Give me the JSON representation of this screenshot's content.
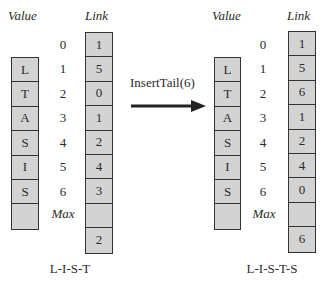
{
  "left": {
    "value_header": "Value",
    "link_header": "Link",
    "indices": [
      "0",
      "1",
      "2",
      "3",
      "4",
      "5",
      "6",
      "Max"
    ],
    "values": [
      "L",
      "T",
      "A",
      "S",
      "I",
      "S",
      ""
    ],
    "links": [
      "1",
      "5",
      "0",
      "1",
      "2",
      "4",
      "3",
      ""
    ],
    "free_link": "2",
    "caption": "L-I-S-T"
  },
  "operation": {
    "label": "InsertTail(6)",
    "arrow": "right-arrow-icon"
  },
  "right": {
    "value_header": "Value",
    "link_header": "Link",
    "indices": [
      "0",
      "1",
      "2",
      "3",
      "4",
      "5",
      "6",
      "Max"
    ],
    "values": [
      "L",
      "T",
      "A",
      "S",
      "I",
      "S",
      ""
    ],
    "links": [
      "1",
      "5",
      "6",
      "1",
      "2",
      "4",
      "0",
      ""
    ],
    "free_link": "6",
    "caption": "L-I-S-T-S"
  },
  "colors": {
    "cell_fill": "#d3d3d3",
    "border": "#333333"
  }
}
